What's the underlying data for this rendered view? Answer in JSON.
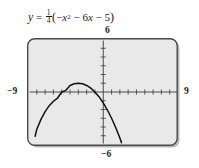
{
  "figure": {
    "equation": {
      "lhs": "y",
      "equals": "=",
      "coefficient_numerator": "1",
      "coefficient_denominator": "4",
      "paren_open": "(",
      "term1_sign": "−",
      "term1_var": "x",
      "term1_exponent": "2",
      "term2": " − 6",
      "term2_var": "x",
      "term3": " − 5",
      "paren_close": ")",
      "plain_text": "y = 1/4(−x² − 6x − 5)"
    },
    "window": {
      "xmin_label": "−9",
      "xmax_label": "9",
      "ymin_label": "−6",
      "ymax_label": "6"
    },
    "colors": {
      "plot_background": "#e9e9e9",
      "frame_border": "#4a4a4a",
      "axis": "#3a3a3a",
      "curve": "#111111",
      "text": "#1a1a1a"
    }
  },
  "chart_data": {
    "type": "line",
    "subtitle": "",
    "xlabel": "x",
    "ylabel": "y",
    "xlim": [
      -9,
      9
    ],
    "ylim": [
      -6,
      6
    ],
    "grid": false,
    "legend_position": "none",
    "x_tick_labels": [
      "−9",
      "9"
    ],
    "y_tick_labels": [
      "−6",
      "6"
    ],
    "tick_interval": 1,
    "annotations": [
      {
        "label": "vertex",
        "x": -3,
        "y": 1
      },
      {
        "label": "x-intercept",
        "x": -5,
        "y": 0
      },
      {
        "label": "x-intercept",
        "x": -1,
        "y": 0
      },
      {
        "label": "y-intercept",
        "x": 0,
        "y": -1.25
      }
    ],
    "series": [
      {
        "name": "y = 1/4(−x² − 6x − 5)",
        "color": "#111111",
        "x": [
          -8.2,
          -8.0,
          -7.5,
          -7.0,
          -6.5,
          -6.0,
          -5.5,
          -5.0,
          -4.5,
          -4.0,
          -3.5,
          -3.0,
          -2.5,
          -2.0,
          -1.5,
          -1.0,
          -0.5,
          0.0,
          0.5,
          1.0,
          1.5,
          2.0,
          2.2
        ],
        "y": [
          -5.06,
          -4.25,
          -3.13,
          -2.25,
          -1.56,
          -1.06,
          -0.69,
          0.0,
          0.19,
          0.75,
          0.94,
          1.0,
          0.94,
          0.75,
          0.44,
          0.0,
          -0.56,
          -1.25,
          -2.06,
          -3.0,
          -4.06,
          -5.25,
          -5.81
        ]
      }
    ]
  }
}
